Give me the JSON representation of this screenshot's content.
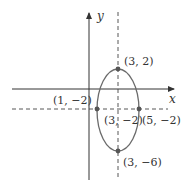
{
  "diagram": {
    "type": "ellipse-graph",
    "axes": {
      "x_label": "x",
      "y_label": "y"
    },
    "colors": {
      "axis": "#333333",
      "ellipse": "#6b6b6b",
      "points": "#555555",
      "dashed": "#444444"
    },
    "ellipse": {
      "center": "(3, −2)",
      "vertices": [
        "(3, 2)",
        "(3, −6)"
      ],
      "co_vertices": [
        "(1, −2)",
        "(5, −2)"
      ]
    },
    "labels": {
      "top": "(3, 2)",
      "bottom": "(3, −6)",
      "left": "(1, −2)",
      "right": "(5, −2)",
      "center": "(3, −2)"
    }
  }
}
